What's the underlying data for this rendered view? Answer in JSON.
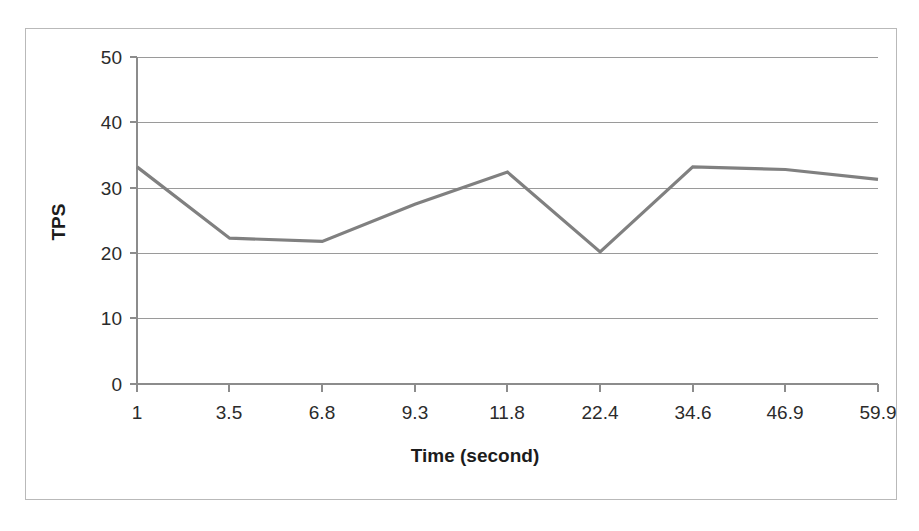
{
  "chart_data": {
    "type": "line",
    "title": "",
    "xlabel": "Time (second)",
    "ylabel": "TPS",
    "categories": [
      "1",
      "3.5",
      "6.8",
      "9.3",
      "11.8",
      "22.4",
      "34.6",
      "46.9",
      "59.9"
    ],
    "values": [
      33.2,
      22.3,
      21.8,
      27.5,
      32.4,
      20.2,
      33.2,
      32.8,
      31.3
    ],
    "series": [
      {
        "name": "TPS",
        "values": [
          33.2,
          22.3,
          21.8,
          27.5,
          32.4,
          20.2,
          33.2,
          32.8,
          31.3
        ],
        "color": "#808080"
      }
    ],
    "ylim": [
      0,
      50
    ],
    "y_ticks": [
      0,
      10,
      20,
      30,
      40,
      50
    ],
    "y_tick_labels": [
      "0",
      "10",
      "20",
      "30",
      "40",
      "50"
    ],
    "x_tick_labels": [
      "1",
      "3.5",
      "6.8",
      "9.3",
      "11.8",
      "22.4",
      "34.6",
      "46.9",
      "59.9"
    ],
    "grid": true,
    "grid_axis": "y",
    "legend": false,
    "legend_position": "none",
    "line_color": "#808080",
    "grid_color": "#9a9a9a",
    "axis_color": "#8c8c8c",
    "text_color": "#2b2b2b",
    "border_color": "#b9b9b9",
    "background": "#ffffff"
  },
  "figure": {
    "xlabel": "Time (second)",
    "ylabel": "TPS"
  }
}
